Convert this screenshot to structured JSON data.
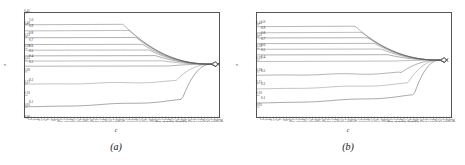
{
  "figure": {
    "panels": [
      {
        "caption": "(a)",
        "xlabel": "c",
        "ylabel": "ε"
      },
      {
        "caption": "(b)",
        "xlabel": "c",
        "ylabel": "ε"
      }
    ]
  },
  "chart_data": [
    {
      "type": "line",
      "panel": "(a)",
      "title": "",
      "xlabel": "c",
      "ylabel": "ε",
      "xlim": [
        0,
        60
      ],
      "ylim": [
        0.0,
        0.45
      ],
      "grid": false,
      "legend": "inline-curve-labels-left",
      "ytick_labels": [
        "0.00",
        "0.05",
        "0.10",
        "0.15",
        "0.20",
        "0.25",
        "0.30",
        "0.35",
        "0.40",
        "0.45"
      ],
      "ytick_values": [
        0.0,
        0.05,
        0.1,
        0.15,
        0.2,
        0.25,
        0.3,
        0.35,
        0.4,
        0.45
      ],
      "xtick_labels": [
        "1",
        "2",
        "3",
        "4",
        "5",
        "6",
        "7",
        "8",
        "9",
        "10",
        "11",
        "12",
        "13",
        "14",
        "15",
        "16",
        "17",
        "18",
        "19",
        "20",
        "21",
        "22",
        "23",
        "24",
        "25",
        "26",
        "27",
        "28",
        "29",
        "30",
        "31",
        "32",
        "33",
        "34",
        "35",
        "36",
        "37",
        "38",
        "39",
        "40",
        "41",
        "42",
        "43",
        "44",
        "45",
        "46",
        "47",
        "48",
        "49",
        "50",
        "51",
        "52",
        "53",
        "54",
        "55",
        "56",
        "57",
        "58",
        "59",
        "60"
      ],
      "convergence_point": {
        "x": 57,
        "y": 0.233
      },
      "series": [
        {
          "name": "1.0",
          "label": "1.0",
          "start_y": 0.4,
          "plateau_y": 0.402,
          "end_y": 0.233,
          "knee_x": 30
        },
        {
          "name": "0.9",
          "label": "0.9",
          "start_y": 0.374,
          "plateau_y": 0.376,
          "end_y": 0.233,
          "knee_x": 32
        },
        {
          "name": "0.8",
          "label": "0.8",
          "start_y": 0.345,
          "plateau_y": 0.346,
          "end_y": 0.233,
          "knee_x": 34
        },
        {
          "name": "0.7",
          "label": "0.7",
          "start_y": 0.316,
          "plateau_y": 0.317,
          "end_y": 0.233,
          "knee_x": 36
        },
        {
          "name": "0.6",
          "label": "0.6",
          "start_y": 0.292,
          "plateau_y": 0.293,
          "end_y": 0.233,
          "knee_x": 38
        },
        {
          "name": "0.5",
          "label": "0.5",
          "start_y": 0.268,
          "plateau_y": 0.269,
          "end_y": 0.233,
          "knee_x": 40
        },
        {
          "name": "0.4",
          "label": "0.4",
          "start_y": 0.246,
          "plateau_y": 0.247,
          "end_y": 0.233,
          "knee_x": 42
        },
        {
          "name": "0.3",
          "label": "0.3",
          "start_y": 0.224,
          "plateau_y": 0.225,
          "end_y": 0.233,
          "knee_x": 44
        },
        {
          "name": "0.2",
          "label": "0.2",
          "start_y": 0.148,
          "plateau_y": 0.16,
          "end_y": 0.233,
          "knee_x": 46
        },
        {
          "name": "0.1",
          "label": "0.1",
          "start_y": 0.052,
          "plateau_y": 0.08,
          "end_y": 0.233,
          "knee_x": 48
        }
      ]
    },
    {
      "type": "line",
      "panel": "(b)",
      "title": "",
      "xlabel": "c",
      "ylabel": "ε",
      "xlim": [
        0,
        60
      ],
      "ylim": [
        0.0,
        0.45
      ],
      "grid": false,
      "legend": "inline-curve-labels-left",
      "ytick_labels": [
        "0.05",
        "0.10",
        "0.15",
        "0.20",
        "0.25",
        "0.30",
        "0.35",
        "0.40"
      ],
      "ytick_values": [
        0.05,
        0.1,
        0.15,
        0.2,
        0.25,
        0.3,
        0.35,
        0.4
      ],
      "xtick_labels": [
        "1",
        "2",
        "3",
        "4",
        "5",
        "6",
        "7",
        "8",
        "9",
        "10",
        "11",
        "12",
        "13",
        "14",
        "15",
        "16",
        "17",
        "18",
        "19",
        "20",
        "21",
        "22",
        "23",
        "24",
        "25",
        "26",
        "27",
        "28",
        "29",
        "30",
        "31",
        "32",
        "33",
        "34",
        "35",
        "36",
        "37",
        "38",
        "39",
        "40",
        "41",
        "42",
        "43",
        "44",
        "45",
        "46",
        "47",
        "48",
        "49",
        "50",
        "51",
        "52",
        "53",
        "54",
        "55",
        "56",
        "57",
        "58",
        "59",
        "60"
      ],
      "convergence_point": {
        "x": 56,
        "y": 0.25
      },
      "series": [
        {
          "name": "1.0",
          "label": "1.0",
          "start_y": 0.392,
          "plateau_y": 0.394,
          "end_y": 0.25,
          "knee_x": 30
        },
        {
          "name": "0.9",
          "label": "0.9",
          "start_y": 0.366,
          "plateau_y": 0.368,
          "end_y": 0.25,
          "knee_x": 32
        },
        {
          "name": "0.8",
          "label": "0.8",
          "start_y": 0.344,
          "plateau_y": 0.345,
          "end_y": 0.25,
          "knee_x": 34
        },
        {
          "name": "0.7",
          "label": "0.7",
          "start_y": 0.32,
          "plateau_y": 0.321,
          "end_y": 0.25,
          "knee_x": 36
        },
        {
          "name": "0.6",
          "label": "0.6",
          "start_y": 0.296,
          "plateau_y": 0.297,
          "end_y": 0.25,
          "knee_x": 38
        },
        {
          "name": "0.5",
          "label": "0.5",
          "start_y": 0.272,
          "plateau_y": 0.273,
          "end_y": 0.25,
          "knee_x": 40
        },
        {
          "name": "0.4",
          "label": "0.4",
          "start_y": 0.244,
          "plateau_y": 0.246,
          "end_y": 0.25,
          "knee_x": 42
        },
        {
          "name": "0.3",
          "label": "0.3",
          "start_y": 0.186,
          "plateau_y": 0.196,
          "end_y": 0.25,
          "knee_x": 44
        },
        {
          "name": "0.2",
          "label": "0.2",
          "start_y": 0.128,
          "plateau_y": 0.15,
          "end_y": 0.25,
          "knee_x": 46
        },
        {
          "name": "0.1",
          "label": "0.1",
          "start_y": 0.068,
          "plateau_y": 0.1,
          "end_y": 0.25,
          "knee_x": 48
        }
      ]
    }
  ]
}
